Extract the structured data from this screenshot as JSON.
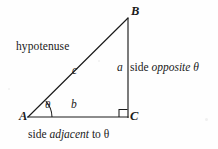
{
  "figure": {
    "background_color": "#fefefe",
    "stroke_color": "#1a1a1a",
    "vertices": {
      "A": "A",
      "B": "B",
      "C": "C"
    },
    "side_labels": {
      "hypotenuse_var": "c",
      "opposite_var": "a",
      "adjacent_var": "b"
    },
    "angle_label": "θ",
    "annotations": {
      "hypotenuse_word": "hypotenuse",
      "opposite_prefix": "side ",
      "opposite_italic": "opposite",
      "opposite_suffix": " θ",
      "adjacent_prefix": "side ",
      "adjacent_italic": "adjacent",
      "adjacent_suffix": " to θ"
    },
    "geometry": {
      "A": [
        28,
        117
      ],
      "B": [
        128,
        18
      ],
      "C": [
        128,
        117
      ],
      "right_angle_mark": "square-at-C"
    }
  }
}
